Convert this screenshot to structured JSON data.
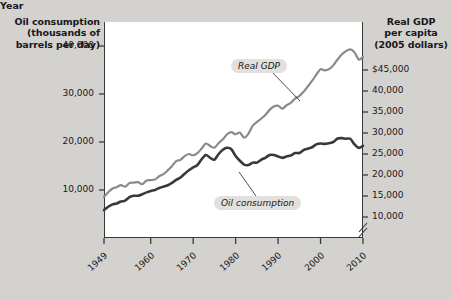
{
  "axes": {
    "left_title": "Oil consumption\n(thousands of\nbarrels per day)",
    "left_title_line1": "Oil consumption",
    "left_title_line2": "(thousands of",
    "left_title_line3": "barrels per day)",
    "right_title_line1": "Real GDP",
    "right_title_line2": "per capita",
    "right_title_line3": "(2005 dollars)",
    "x_title": "Year"
  },
  "chart_data": {
    "type": "line",
    "title": "",
    "xlabel": "Year",
    "ylabel": "Oil consumption (thousands of barrels per day)",
    "y2label": "Real GDP per capita (2005 dollars)",
    "grid": false,
    "legend": "inline-annotations",
    "xlim": [
      1949,
      2010
    ],
    "xticks": [
      1949,
      1960,
      1970,
      1980,
      1990,
      2000,
      2010
    ],
    "xtick_labels": [
      "1949",
      "1960",
      "1970",
      "1980",
      "1990",
      "2000",
      "2010"
    ],
    "ylim": [
      0,
      45000
    ],
    "yticks": [
      10000,
      20000,
      30000,
      40000
    ],
    "ytick_labels": [
      "10,000",
      "20,000",
      "30,000",
      "40,000"
    ],
    "y2lim": [
      5000,
      45000
    ],
    "y2ticks": [
      10000,
      15000,
      20000,
      25000,
      30000,
      35000,
      40000,
      45000
    ],
    "y2tick_labels": [
      "10,000",
      "15,000",
      "20,000",
      "25,000",
      "30,000",
      "35,000",
      "40,000",
      "$45,000"
    ],
    "axis_break_right": true,
    "axis_break_bottom_right": true,
    "series": [
      {
        "name": "Real GDP",
        "axis": "right",
        "color": "#8a8a8a",
        "label_text": "Real GDP",
        "x": [
          1949,
          1950,
          1951,
          1952,
          1953,
          1954,
          1955,
          1956,
          1957,
          1958,
          1959,
          1960,
          1961,
          1962,
          1963,
          1964,
          1965,
          1966,
          1967,
          1968,
          1969,
          1970,
          1971,
          1972,
          1973,
          1974,
          1975,
          1976,
          1977,
          1978,
          1979,
          1980,
          1981,
          1982,
          1983,
          1984,
          1985,
          1986,
          1987,
          1988,
          1989,
          1990,
          1991,
          1992,
          1993,
          1994,
          1995,
          1996,
          1997,
          1998,
          1999,
          2000,
          2001,
          2002,
          2003,
          2004,
          2005,
          2006,
          2007,
          2008,
          2009,
          2010
        ],
        "values": [
          14800,
          15900,
          16800,
          17100,
          17600,
          17200,
          18100,
          18200,
          18300,
          17800,
          18700,
          18800,
          18900,
          19700,
          20200,
          21100,
          22100,
          23300,
          23600,
          24500,
          25000,
          24700,
          25200,
          26300,
          27500,
          26900,
          26500,
          27600,
          28500,
          29700,
          30200,
          29700,
          30100,
          28900,
          29800,
          31700,
          32600,
          33400,
          34300,
          35500,
          36300,
          36500,
          35800,
          36600,
          37200,
          38200,
          38800,
          39800,
          41100,
          42400,
          43900,
          45200,
          44900,
          45200,
          46100,
          47500,
          48700,
          49500,
          49900,
          49200,
          47500,
          48100
        ],
        "comment": "approximate real GDP per capita in 2005 dollars"
      },
      {
        "name": "Oil consumption",
        "axis": "left",
        "color": "#3a383a",
        "label_text": "Oil consumption",
        "x": [
          1949,
          1950,
          1951,
          1952,
          1953,
          1954,
          1955,
          1956,
          1957,
          1958,
          1959,
          1960,
          1961,
          1962,
          1963,
          1964,
          1965,
          1966,
          1967,
          1968,
          1969,
          1970,
          1971,
          1972,
          1973,
          1974,
          1975,
          1976,
          1977,
          1978,
          1979,
          1980,
          1981,
          1982,
          1983,
          1984,
          1985,
          1986,
          1987,
          1988,
          1989,
          1990,
          1991,
          1992,
          1993,
          1994,
          1995,
          1996,
          1997,
          1998,
          1999,
          2000,
          2001,
          2002,
          2003,
          2004,
          2005,
          2006,
          2007,
          2008,
          2009,
          2010
        ],
        "values": [
          5800,
          6500,
          7000,
          7200,
          7600,
          7800,
          8500,
          8800,
          8800,
          9100,
          9500,
          9800,
          10000,
          10400,
          10700,
          11000,
          11500,
          12100,
          12600,
          13400,
          14100,
          14700,
          15200,
          16400,
          17300,
          16700,
          16300,
          17500,
          18400,
          18800,
          18500,
          17100,
          16100,
          15300,
          15200,
          15700,
          15700,
          16300,
          16700,
          17300,
          17300,
          17000,
          16700,
          17000,
          17200,
          17700,
          17700,
          18300,
          18600,
          18900,
          19500,
          19700,
          19600,
          19760,
          20000,
          20730,
          20800,
          20690,
          20680,
          19500,
          18770,
          19180
        ],
        "comment": "approximate US petroleum consumption, thousands of barrels per day"
      }
    ]
  }
}
